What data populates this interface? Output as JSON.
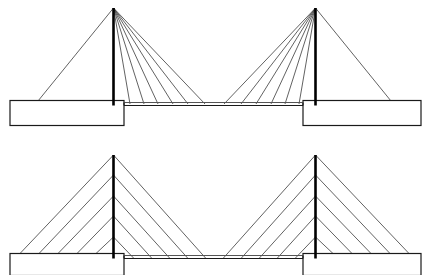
{
  "figure": {
    "canvas": {
      "width": 434,
      "height": 275
    },
    "background_color": "#ffffff",
    "line_color": "#1a1a1a",
    "cable_color": "#3a3a3a",
    "deck_color": "#555555",
    "tower_color": "#000000",
    "cable_width": 0.8,
    "deck_width": 1.2,
    "tower_width": 2.6
  },
  "diagrams": [
    {
      "id": "fan-bridge",
      "name": "fan-configuration-bridge",
      "label": "Fan arrangement cable-stayed bridge",
      "deck": {
        "left_block": {
          "x": 10,
          "y": 100.5,
          "width": 114,
          "height": 25
        },
        "right_block": {
          "x": 303,
          "y": 100.5,
          "width": 118,
          "height": 25
        },
        "center_span": {
          "x1": 124,
          "y1": 105.5,
          "x2": 303,
          "y2": 105.5
        },
        "left_block_top_y": 100.5,
        "right_block_top_y": 100.5
      },
      "towers": [
        {
          "name": "left-tower",
          "x": 113.5,
          "top_y": 8,
          "base_y": 105.5
        },
        {
          "name": "right-tower",
          "x": 315.5,
          "top_y": 8,
          "base_y": 105.5
        }
      ],
      "cables": {
        "type": "fan",
        "converge_at_tower_top": true,
        "left_tower": {
          "anchor_x": 113.5,
          "anchor_y": 8,
          "back_stays": [
            {
              "x": 38,
              "y": 101
            }
          ],
          "fore_stays": [
            {
              "x": 130,
              "y": 104
            },
            {
              "x": 144,
              "y": 104
            },
            {
              "x": 158,
              "y": 104
            },
            {
              "x": 173,
              "y": 104
            },
            {
              "x": 188,
              "y": 104
            },
            {
              "x": 205,
              "y": 104
            }
          ]
        },
        "right_tower": {
          "anchor_x": 315.5,
          "anchor_y": 8,
          "back_stays": [
            {
              "x": 391,
              "y": 101
            }
          ],
          "fore_stays": [
            {
              "x": 299,
              "y": 104
            },
            {
              "x": 285,
              "y": 104
            },
            {
              "x": 271,
              "y": 104
            },
            {
              "x": 256,
              "y": 104
            },
            {
              "x": 241,
              "y": 104
            },
            {
              "x": 224,
              "y": 104
            }
          ]
        }
      }
    },
    {
      "id": "harp-bridge",
      "name": "harp-configuration-bridge",
      "label": "Harp arrangement cable-stayed bridge",
      "deck": {
        "left_block": {
          "x": 10,
          "y": 253.5,
          "width": 114,
          "height": 22
        },
        "right_block": {
          "x": 303,
          "y": 253.5,
          "width": 118,
          "height": 22
        },
        "center_span": {
          "x1": 124,
          "y1": 258.5,
          "x2": 303,
          "y2": 258.5
        },
        "left_block_top_y": 253.5,
        "right_block_top_y": 253.5
      },
      "towers": [
        {
          "name": "left-tower",
          "x": 113.5,
          "top_y": 155,
          "base_y": 258.5
        },
        {
          "name": "right-tower",
          "x": 315.5,
          "top_y": 155,
          "base_y": 258.5
        }
      ],
      "cables": {
        "type": "harp",
        "converge_at_tower_top": false,
        "tower_attach_levels": [
          155,
          175,
          196,
          216,
          237
        ],
        "left_tower": {
          "anchor_x": 113.5,
          "pairs": [
            {
              "tower_y": 155,
              "back_x": 20,
              "fore_x": 206
            },
            {
              "tower_y": 175,
              "back_x": 39,
              "fore_x": 188
            },
            {
              "tower_y": 196,
              "back_x": 58,
              "fore_x": 170
            },
            {
              "tower_y": 216,
              "back_x": 77,
              "fore_x": 152
            },
            {
              "tower_y": 237,
              "back_x": 96,
              "fore_x": 134
            }
          ]
        },
        "right_tower": {
          "anchor_x": 315.5,
          "pairs": [
            {
              "tower_y": 155,
              "back_x": 409,
              "fore_x": 223
            },
            {
              "tower_y": 175,
              "back_x": 390,
              "fore_x": 241
            },
            {
              "tower_y": 196,
              "back_x": 371,
              "fore_x": 259
            },
            {
              "tower_y": 216,
              "back_x": 352,
              "fore_x": 277
            },
            {
              "tower_y": 237,
              "back_x": 333,
              "fore_x": 295
            }
          ]
        },
        "deck_anchor_y_left_block": 253.5,
        "deck_anchor_y_span": 258.5
      }
    }
  ]
}
